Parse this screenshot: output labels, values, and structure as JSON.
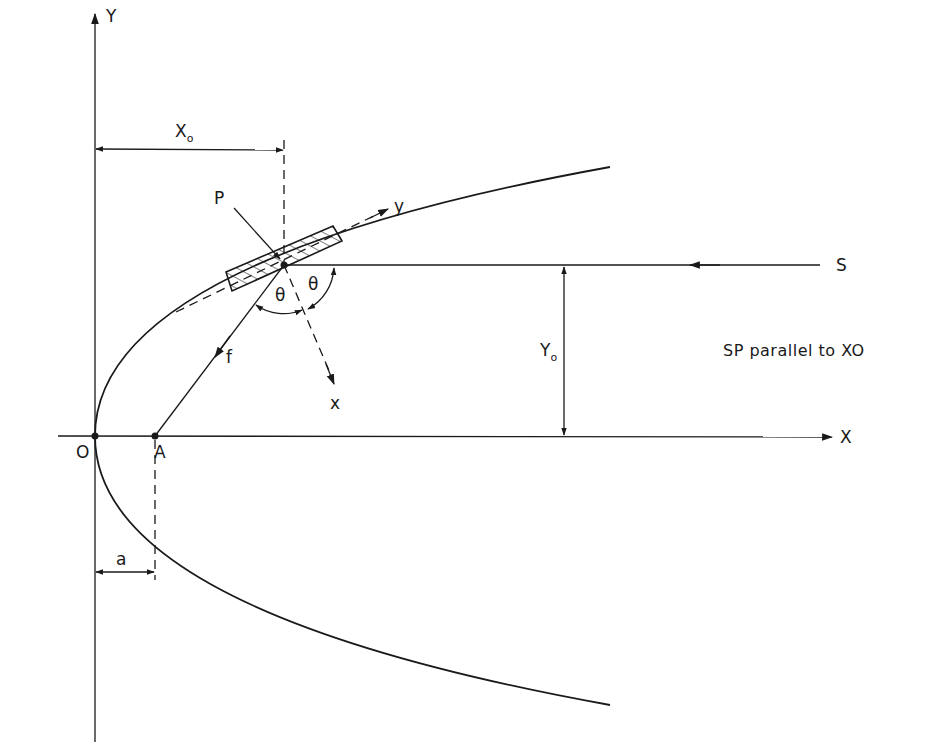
{
  "figure": {
    "type": "geometric-diagram"
  },
  "axes": {
    "x_label": "X",
    "y_label": "Y",
    "origin_label": "O"
  },
  "points": {
    "origin": "O",
    "focus": "A",
    "reflector_point": "P",
    "source": "S"
  },
  "local_axes": {
    "x_label": "x",
    "y_label": "y"
  },
  "dimensions": {
    "x0_main": "X",
    "x0_sub": "o",
    "y0_main": "Y",
    "y0_sub": "o",
    "focal_offset": "a",
    "focal_length": "f"
  },
  "angles": {
    "incidence": "θ",
    "reflection": "θ"
  },
  "note": "SP parallel to XO",
  "colors": {
    "ink": "#1a1a1a",
    "background": "#ffffff"
  }
}
